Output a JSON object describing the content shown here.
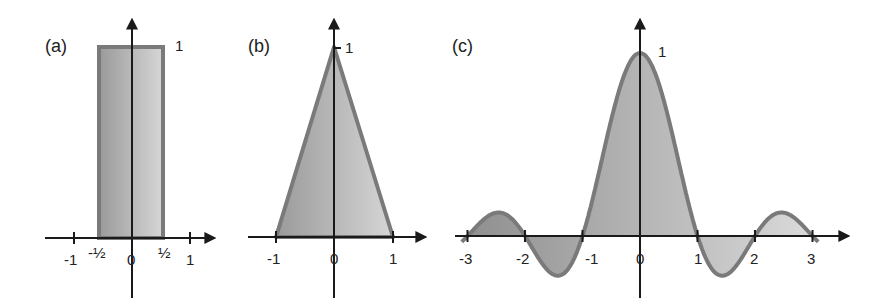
{
  "panels": [
    {
      "label": "(a)",
      "function": "rect",
      "peak_label": "1",
      "x_ticks": [
        "-1",
        "-½",
        "0",
        "½",
        "1"
      ]
    },
    {
      "label": "(b)",
      "function": "triangle",
      "peak_label": "1",
      "x_ticks": [
        "-1",
        "0",
        "1"
      ]
    },
    {
      "label": "(c)",
      "function": "sinc",
      "peak_label": "1",
      "x_ticks": [
        "-3",
        "-2",
        "-1",
        "0",
        "1",
        "2",
        "3"
      ]
    }
  ],
  "colors": {
    "axis": "#1a1a1a",
    "curve": "#7a7a7a",
    "fill_dark": "#9a9a9a",
    "fill_light": "#d4d4d4"
  },
  "chart_data": [
    {
      "type": "area",
      "title": "(a)",
      "function": "rect(x)",
      "x": [
        -1,
        -0.5,
        -0.5,
        0.5,
        0.5,
        1
      ],
      "y": [
        0,
        0,
        1,
        1,
        0,
        0
      ],
      "xticks": [
        "-1",
        "-½",
        "0",
        "½",
        "1"
      ],
      "annotations": [
        "1"
      ],
      "xlim": [
        -1.5,
        1.4
      ],
      "ylim": [
        0,
        1.2
      ],
      "grid": false
    },
    {
      "type": "area",
      "title": "(b)",
      "function": "tri(x)",
      "x": [
        -1,
        0,
        1
      ],
      "y": [
        0,
        1,
        0
      ],
      "xticks": [
        "-1",
        "0",
        "1"
      ],
      "annotations": [
        "1"
      ],
      "xlim": [
        -1.5,
        1.6
      ],
      "ylim": [
        0,
        1.2
      ],
      "grid": false
    },
    {
      "type": "area",
      "title": "(c)",
      "function": "sinc(x) = sin(πx)/(πx)",
      "x": [
        -3,
        -2.5,
        -2,
        -1.5,
        -1,
        -0.5,
        0,
        0.5,
        1,
        1.5,
        2,
        2.5,
        3
      ],
      "y": [
        0,
        0.127,
        0,
        -0.212,
        0,
        0.637,
        1,
        0.637,
        0,
        -0.212,
        0,
        0.127,
        0
      ],
      "xticks": [
        "-3",
        "-2",
        "-1",
        "0",
        "1",
        "2",
        "3"
      ],
      "annotations": [
        "1"
      ],
      "xlim": [
        -3.2,
        3.6
      ],
      "ylim": [
        -0.3,
        1.2
      ],
      "grid": false
    }
  ]
}
